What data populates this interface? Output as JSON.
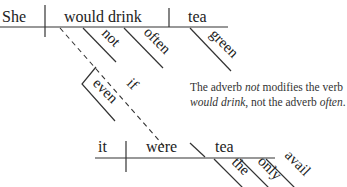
{
  "diagram": {
    "type": "reed-kellogg-sentence-diagram",
    "main_clause": {
      "subject": "She",
      "verb": "would drink",
      "object": "tea",
      "verb_modifiers": [
        "not",
        "often"
      ],
      "object_modifiers": [
        "green"
      ]
    },
    "connector": {
      "conjunction": "if",
      "modifier": "even"
    },
    "subordinate_clause": {
      "subject": "it",
      "verb": "were",
      "complement": "tea",
      "complement_modifiers": [
        "the",
        "only",
        "avail"
      ]
    },
    "note": {
      "part1": "The adverb ",
      "em1": "not",
      "part2": " modifies the verb ",
      "em2": "would drink",
      "part3": ", not the adverb ",
      "em3": "often",
      "part4": "."
    }
  }
}
